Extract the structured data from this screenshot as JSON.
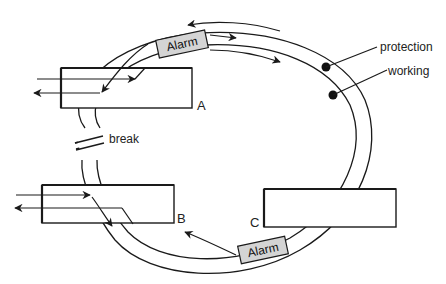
{
  "diagram": {
    "type": "ring-protection-switching",
    "labels": {
      "protection": "protection",
      "working": "working",
      "break": "break",
      "node_a": "A",
      "node_b": "B",
      "node_c": "C",
      "alarm_top": "Alarm",
      "alarm_bottom": "Alarm"
    },
    "colors": {
      "line": "#1a1a1a",
      "alarm_fill": "#d4d4d4",
      "background": "#ffffff"
    }
  }
}
